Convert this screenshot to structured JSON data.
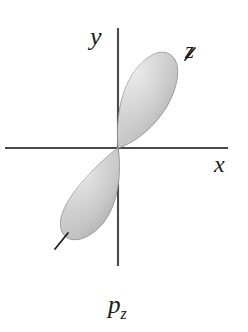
{
  "figure": {
    "kind": "atomic-orbital-diagram",
    "caption_main": "p",
    "caption_sub": "z",
    "background_color": "#ffffff",
    "axes": {
      "line_color": "#4a4a4a",
      "stroke_width": 2,
      "horizontal": {
        "label": "x",
        "x1": 5,
        "y1": 148,
        "x2": 228,
        "y2": 148
      },
      "vertical": {
        "label": "y",
        "x1": 118,
        "y1": 28,
        "x2": 118,
        "y2": 266
      },
      "z_axis": {
        "label": "z",
        "tick_color": "#1a1a1a"
      }
    },
    "lobes": [
      {
        "name": "upper-lobe",
        "orientation": "upper-right",
        "tip": {
          "x": 118,
          "y": 148
        },
        "far_end": {
          "x": 170,
          "y": 56
        },
        "fill_light": "#d9d9d9",
        "fill_mid": "#bdbdbd",
        "fill_dark": "#a3a3a3",
        "edge_color": "#9a9a9a"
      },
      {
        "name": "lower-lobe",
        "orientation": "lower-left",
        "tip": {
          "x": 118,
          "y": 148
        },
        "far_end": {
          "x": 64,
          "y": 238
        },
        "fill_light": "#d9d9d9",
        "fill_mid": "#bdbdbd",
        "fill_dark": "#a3a3a3",
        "edge_color": "#9a9a9a"
      }
    ],
    "z_ticks": [
      {
        "name": "z-tick-upper",
        "x1": 186,
        "y1": 59,
        "x2": 196,
        "y2": 49
      },
      {
        "name": "z-tick-lower",
        "x1": 56,
        "y1": 248,
        "x2": 68,
        "y2": 234
      }
    ]
  }
}
